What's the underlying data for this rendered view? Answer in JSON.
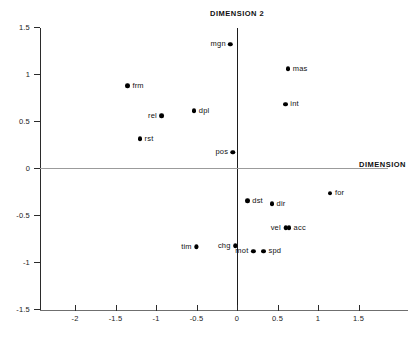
{
  "chart_data": {
    "type": "scatter",
    "title": "",
    "xlabel": "DIMENSION",
    "ylabel": "DIMENSION 2",
    "xlim": [
      -2.45,
      1.75
    ],
    "ylim": [
      -1.5,
      1.5
    ],
    "xticks": [
      "-2",
      "-1.5",
      "-1",
      "-0.5",
      "0",
      "0.5",
      "1",
      "1.5"
    ],
    "xtick_values": [
      -2,
      -1.5,
      -1,
      -0.5,
      0,
      0.5,
      1,
      1.5
    ],
    "yticks": [
      "1.5",
      "1",
      "0.5",
      "0",
      "-0.5",
      "-1",
      "-1.5"
    ],
    "ytick_values": [
      1.5,
      1,
      0.5,
      0,
      -0.5,
      -1,
      -1.5
    ],
    "grid": false,
    "legend": "none",
    "zero_lines": true,
    "marker_color": "#000000",
    "axis_color": "#2b2b2b",
    "points": [
      {
        "label": "mgn",
        "x": -0.08,
        "y": 1.32,
        "label_side": "left"
      },
      {
        "label": "mas",
        "x": 0.63,
        "y": 1.06,
        "label_side": "right"
      },
      {
        "label": "frm",
        "x": -1.35,
        "y": 0.88,
        "label_side": "right"
      },
      {
        "label": "int",
        "x": 0.6,
        "y": 0.68,
        "label_side": "right"
      },
      {
        "label": "dpl",
        "x": -0.53,
        "y": 0.61,
        "label_side": "right"
      },
      {
        "label": "rel",
        "x": -0.93,
        "y": 0.56,
        "label_side": "left"
      },
      {
        "label": "rst",
        "x": -1.2,
        "y": 0.31,
        "label_side": "right"
      },
      {
        "label": "pos",
        "x": -0.05,
        "y": 0.17,
        "label_side": "left"
      },
      {
        "label": "for",
        "x": 1.15,
        "y": -0.27,
        "label_side": "right"
      },
      {
        "label": "dst",
        "x": 0.13,
        "y": -0.35,
        "label_side": "right"
      },
      {
        "label": "dir",
        "x": 0.43,
        "y": -0.38,
        "label_side": "right"
      },
      {
        "label": "vel",
        "x": 0.6,
        "y": -0.64,
        "label_side": "left"
      },
      {
        "label": "acc",
        "x": 0.64,
        "y": -0.64,
        "label_side": "right"
      },
      {
        "label": "tim",
        "x": -0.5,
        "y": -0.84,
        "label_side": "left"
      },
      {
        "label": "chg",
        "x": -0.02,
        "y": -0.83,
        "label_side": "left"
      },
      {
        "label": "mot",
        "x": 0.2,
        "y": -0.89,
        "label_side": "left"
      },
      {
        "label": "spd",
        "x": 0.33,
        "y": -0.89,
        "label_side": "right"
      }
    ]
  }
}
